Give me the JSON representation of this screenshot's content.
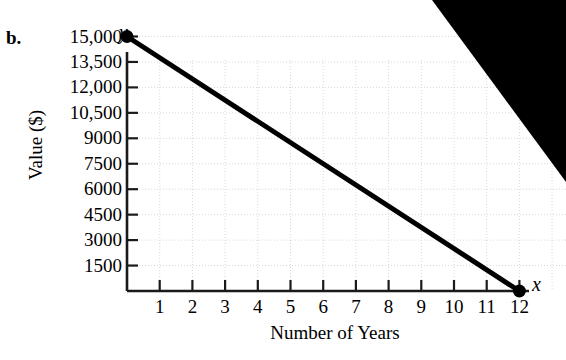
{
  "part_label": "b.",
  "chart_data": {
    "type": "line",
    "title": "",
    "xlabel": "Number of Years",
    "ylabel": "Value ($)",
    "x_axis_letter": "y",
    "y_axis_letter": "x",
    "axis_letters": {
      "vertical": "y",
      "horizontal": "x"
    },
    "x": [
      0,
      12
    ],
    "values": [
      15000,
      0
    ],
    "series": [
      {
        "name": "Value",
        "x": [
          0,
          12
        ],
        "values": [
          15000,
          0
        ]
      }
    ],
    "points": [
      {
        "x": 0,
        "y": 15000,
        "marker": "filled-circle"
      },
      {
        "x": 12,
        "y": 0,
        "marker": "filled-circle"
      }
    ],
    "xlim": [
      0,
      12.6
    ],
    "ylim": [
      0,
      15750
    ],
    "x_ticks": [
      1,
      2,
      3,
      4,
      5,
      6,
      7,
      8,
      9,
      10,
      11,
      12
    ],
    "x_tick_labels": [
      "1",
      "2",
      "3",
      "4",
      "5",
      "6",
      "7",
      "8",
      "9",
      "10",
      "11",
      "12"
    ],
    "y_ticks": [
      1500,
      3000,
      4500,
      6000,
      7500,
      9000,
      10500,
      12000,
      13500,
      15000
    ],
    "y_tick_labels": [
      "1500",
      "3000",
      "4500",
      "6000",
      "7500",
      "9000",
      "10,500",
      "12,000",
      "13,500",
      "15,000"
    ],
    "grid": true,
    "grid_style": "dotted",
    "grid_color": "#d8d8d8",
    "legend": "none",
    "line_color": "#000000",
    "line_width": 5,
    "slope": -1250,
    "intercept": 15000
  },
  "colors": {
    "line": "#000000",
    "axis": "#1a1a1a",
    "grid": "#d8d8d8",
    "artifact": "#000000",
    "background": "#ffffff"
  },
  "artifact": {
    "name": "scan-shadow-wedge",
    "points": "432,0 566,0 566,182"
  }
}
